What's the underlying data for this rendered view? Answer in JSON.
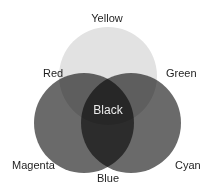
{
  "diagram": {
    "type": "venn",
    "sets": [
      {
        "id": "top",
        "name": "Yellow",
        "cx": 108,
        "cy": 76,
        "r": 49,
        "fill": "#e2e2e2"
      },
      {
        "id": "left",
        "name": "Magenta",
        "cx": 84,
        "cy": 123,
        "r": 50,
        "fill": "#6a6a6a"
      },
      {
        "id": "right",
        "name": "Cyan",
        "cx": 131,
        "cy": 123,
        "r": 50,
        "fill": "#6a6a6a"
      }
    ],
    "labels": {
      "yellow": "Yellow",
      "red": "Red",
      "green": "Green",
      "black": "Black",
      "magenta": "Magenta",
      "cyan": "Cyan",
      "blue": "Blue"
    },
    "regions": [
      {
        "label": "Yellow",
        "sets": [
          "top"
        ]
      },
      {
        "label": "Magenta",
        "sets": [
          "left"
        ]
      },
      {
        "label": "Cyan",
        "sets": [
          "right"
        ]
      },
      {
        "label": "Red",
        "sets": [
          "top",
          "left"
        ]
      },
      {
        "label": "Green",
        "sets": [
          "top",
          "right"
        ]
      },
      {
        "label": "Blue",
        "sets": [
          "left",
          "right"
        ]
      },
      {
        "label": "Black",
        "sets": [
          "top",
          "left",
          "right"
        ]
      }
    ],
    "colors": {
      "background": "#ffffff",
      "text": "#1e1e1e",
      "inverse_text": "#ececec"
    }
  }
}
